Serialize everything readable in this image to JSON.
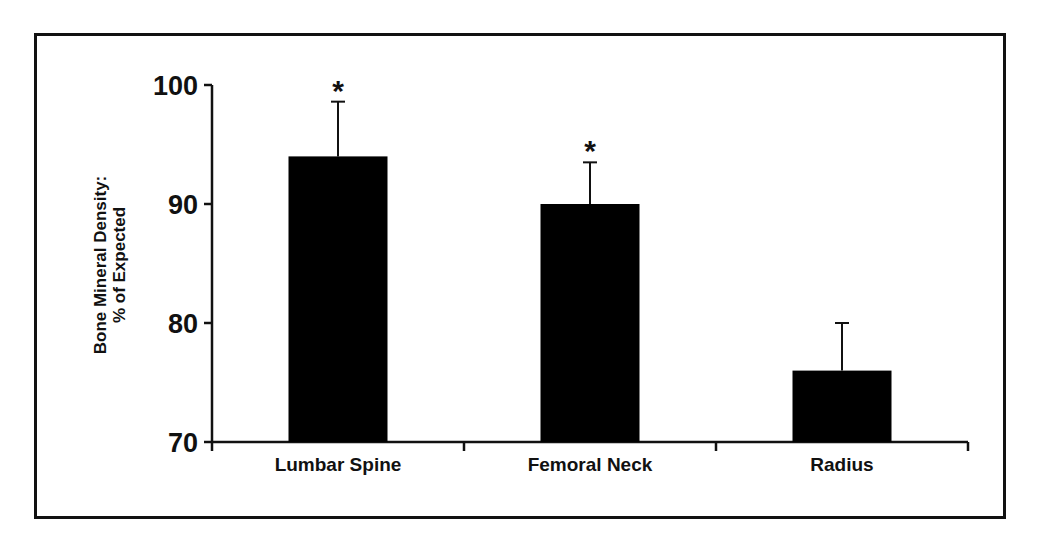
{
  "chart_data": {
    "type": "bar",
    "title": "",
    "xlabel": "",
    "ylabel": "Bone Mineral Density: % of Expected",
    "ylabel_lines": [
      "Bone Mineral Density:",
      "% of Expected"
    ],
    "categories": [
      "Lumbar Spine",
      "Femoral Neck",
      "Radius"
    ],
    "values": [
      94,
      90,
      76
    ],
    "error_upper": [
      4.6,
      3.5,
      4.0
    ],
    "significance": [
      "*",
      "*",
      ""
    ],
    "ylim": [
      70,
      100
    ],
    "yticks": [
      70,
      80,
      90,
      100
    ],
    "ytick_labels": [
      "70",
      "80",
      "90",
      "100"
    ],
    "grid": false,
    "legend": null,
    "bar_color": "#000000"
  }
}
